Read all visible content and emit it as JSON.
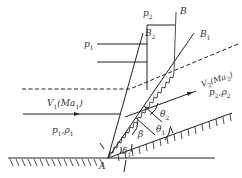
{
  "labels": {
    "p2_top": {
      "main": "p",
      "sub": "2"
    },
    "B": {
      "main": "B",
      "sub": ""
    },
    "B2": {
      "main": "B",
      "sub": "2"
    },
    "B1": {
      "main": "B",
      "sub": "1"
    },
    "p1_left": {
      "main": "p",
      "sub": "1"
    },
    "V2": {
      "text": "V",
      "sub": "2",
      "paren": "(Ma",
      "paren_sub": "2",
      "close": ")"
    },
    "V1": {
      "text": "V",
      "sub": "1",
      "paren": "(Ma",
      "paren_sub": "1",
      "close": ")"
    },
    "p2rho2": {
      "a": "p",
      "a_sub": "2",
      "sep": ",",
      "b": "ρ",
      "b_sub": "2"
    },
    "p1rho1": {
      "a": "p",
      "a_sub": "1",
      "sep": ",",
      "b": "ρ",
      "b_sub": "1"
    },
    "theta2": {
      "main": "θ",
      "sub": "2"
    },
    "theta1": {
      "main": "θ",
      "sub": "1"
    },
    "beta": {
      "main": "β",
      "sub": ""
    },
    "delta1": {
      "main": "δ",
      "sub": "1"
    },
    "A": {
      "main": "A",
      "sub": ""
    }
  },
  "colors": {
    "stroke": "#222222",
    "background": "#ffffff"
  }
}
